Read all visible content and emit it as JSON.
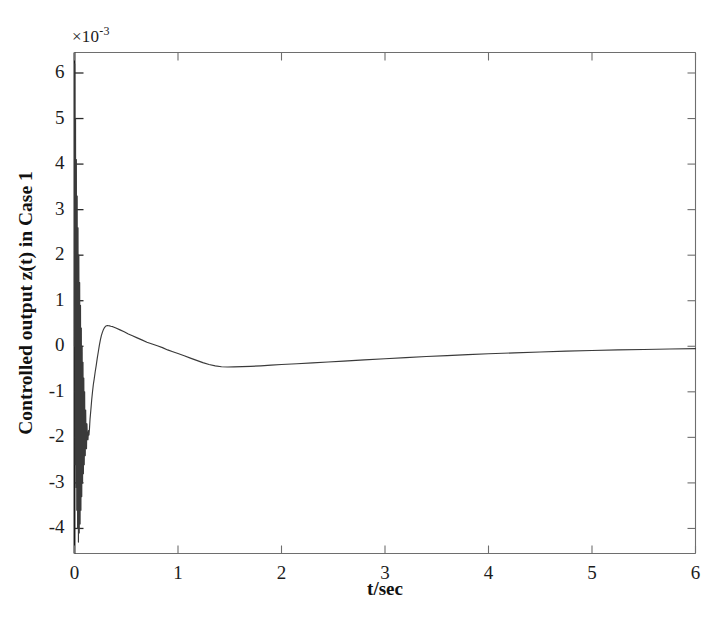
{
  "chart_data": {
    "type": "line",
    "title": "",
    "xlabel": "t/sec",
    "ylabel": "Controlled output z(t) in Case 1",
    "y_exponent_label": "×10",
    "y_exponent_value": "-3",
    "y_scale_factor": 0.001,
    "xlim": [
      0,
      6
    ],
    "ylim": [
      -4.55,
      6.45
    ],
    "xticks": [
      0,
      1,
      2,
      3,
      4,
      5,
      6
    ],
    "xtick_labels": [
      "0",
      "1",
      "2",
      "3",
      "4",
      "5",
      "6"
    ],
    "yticks": [
      6,
      5,
      4,
      3,
      2,
      1,
      0,
      -1,
      -2,
      -3,
      -4
    ],
    "ytick_labels": [
      "6",
      "5",
      "4",
      "3",
      "2",
      "1",
      "0",
      "-1",
      "-2",
      "-3",
      "-4"
    ],
    "grid": false,
    "legend": null,
    "line_color": "#3a3a3a",
    "background_color": "#ffffff",
    "axis_color": "#6e6e6e",
    "series": [
      {
        "name": "z(t) Case 1",
        "units": "x10^-3",
        "comment": "Values in units of 1e-3. Fast oscillatory transient near t=0 decaying within ~0.12 s, then smooth rise to a positive peak ~0.45 near t=0.30, decay through zero near t=0.85 to a trough ~-0.45 near t=1.45, then slow asymptotic approach toward ~-0.05 at t=6.",
        "points": [
          [
            0.0,
            0.0
          ],
          [
            0.002,
            6.2
          ],
          [
            0.004,
            2.1
          ],
          [
            0.006,
            -2.6
          ],
          [
            0.008,
            0.9
          ],
          [
            0.01,
            5.0
          ],
          [
            0.012,
            1.2
          ],
          [
            0.014,
            -3.1
          ],
          [
            0.016,
            -0.4
          ],
          [
            0.018,
            4.1
          ],
          [
            0.02,
            0.6
          ],
          [
            0.022,
            -3.6
          ],
          [
            0.024,
            -1.1
          ],
          [
            0.026,
            3.3
          ],
          [
            0.028,
            0.1
          ],
          [
            0.03,
            -4.0
          ],
          [
            0.032,
            -1.5
          ],
          [
            0.034,
            2.6
          ],
          [
            0.036,
            -0.3
          ],
          [
            0.038,
            -4.3
          ],
          [
            0.04,
            -1.8
          ],
          [
            0.042,
            2.0
          ],
          [
            0.044,
            -0.7
          ],
          [
            0.046,
            -4.1
          ],
          [
            0.048,
            -1.95
          ],
          [
            0.05,
            1.4
          ],
          [
            0.052,
            -1.0
          ],
          [
            0.054,
            -3.9
          ],
          [
            0.056,
            -2.05
          ],
          [
            0.058,
            0.9
          ],
          [
            0.06,
            -1.25
          ],
          [
            0.062,
            -3.6
          ],
          [
            0.064,
            -2.1
          ],
          [
            0.066,
            0.4
          ],
          [
            0.068,
            -1.45
          ],
          [
            0.07,
            -3.3
          ],
          [
            0.072,
            -2.12
          ],
          [
            0.074,
            0.0
          ],
          [
            0.076,
            -1.6
          ],
          [
            0.078,
            -3.0
          ],
          [
            0.08,
            -2.14
          ],
          [
            0.082,
            -0.35
          ],
          [
            0.084,
            -1.72
          ],
          [
            0.086,
            -2.8
          ],
          [
            0.088,
            -2.15
          ],
          [
            0.09,
            -0.7
          ],
          [
            0.092,
            -1.82
          ],
          [
            0.094,
            -2.6
          ],
          [
            0.096,
            -2.15
          ],
          [
            0.098,
            -1.0
          ],
          [
            0.1,
            -1.9
          ],
          [
            0.104,
            -2.4
          ],
          [
            0.108,
            -1.4
          ],
          [
            0.112,
            -2.1
          ],
          [
            0.116,
            -2.25
          ],
          [
            0.12,
            -1.7
          ],
          [
            0.125,
            -2.05
          ],
          [
            0.13,
            -2.05
          ],
          [
            0.135,
            -1.85
          ],
          [
            0.14,
            -1.95
          ],
          [
            0.145,
            -1.8
          ],
          [
            0.15,
            -1.6
          ],
          [
            0.158,
            -1.4
          ],
          [
            0.166,
            -1.18
          ],
          [
            0.174,
            -1.0
          ],
          [
            0.182,
            -0.84
          ],
          [
            0.19,
            -0.72
          ],
          [
            0.2,
            -0.56
          ],
          [
            0.21,
            -0.42
          ],
          [
            0.22,
            -0.26
          ],
          [
            0.23,
            -0.12
          ],
          [
            0.24,
            0.02
          ],
          [
            0.25,
            0.14
          ],
          [
            0.26,
            0.24
          ],
          [
            0.27,
            0.31
          ],
          [
            0.28,
            0.37
          ],
          [
            0.29,
            0.41
          ],
          [
            0.3,
            0.44
          ],
          [
            0.31,
            0.45
          ],
          [
            0.32,
            0.455
          ],
          [
            0.33,
            0.45
          ],
          [
            0.34,
            0.447
          ],
          [
            0.35,
            0.44
          ],
          [
            0.37,
            0.43
          ],
          [
            0.4,
            0.4
          ],
          [
            0.44,
            0.36
          ],
          [
            0.48,
            0.32
          ],
          [
            0.52,
            0.27
          ],
          [
            0.56,
            0.23
          ],
          [
            0.6,
            0.19
          ],
          [
            0.65,
            0.14
          ],
          [
            0.7,
            0.09
          ],
          [
            0.75,
            0.05
          ],
          [
            0.8,
            0.01
          ],
          [
            0.85,
            -0.03
          ],
          [
            0.9,
            -0.08
          ],
          [
            0.95,
            -0.12
          ],
          [
            1.0,
            -0.16
          ],
          [
            1.06,
            -0.21
          ],
          [
            1.12,
            -0.26
          ],
          [
            1.18,
            -0.31
          ],
          [
            1.24,
            -0.36
          ],
          [
            1.3,
            -0.4
          ],
          [
            1.36,
            -0.43
          ],
          [
            1.42,
            -0.45
          ],
          [
            1.48,
            -0.455
          ],
          [
            1.54,
            -0.452
          ],
          [
            1.62,
            -0.447
          ],
          [
            1.7,
            -0.44
          ],
          [
            1.8,
            -0.43
          ],
          [
            1.9,
            -0.415
          ],
          [
            2.0,
            -0.4
          ],
          [
            2.15,
            -0.385
          ],
          [
            2.3,
            -0.365
          ],
          [
            2.45,
            -0.345
          ],
          [
            2.6,
            -0.325
          ],
          [
            2.8,
            -0.3
          ],
          [
            3.0,
            -0.275
          ],
          [
            3.2,
            -0.25
          ],
          [
            3.4,
            -0.225
          ],
          [
            3.6,
            -0.205
          ],
          [
            3.8,
            -0.185
          ],
          [
            4.0,
            -0.165
          ],
          [
            4.25,
            -0.145
          ],
          [
            4.5,
            -0.125
          ],
          [
            4.75,
            -0.108
          ],
          [
            5.0,
            -0.092
          ],
          [
            5.25,
            -0.08
          ],
          [
            5.5,
            -0.07
          ],
          [
            5.75,
            -0.06
          ],
          [
            6.0,
            -0.052
          ]
        ]
      }
    ]
  },
  "axes": {
    "x_axis_label": "t/sec",
    "y_axis_label": "Controlled output z(t) in Case 1",
    "exponent_prefix": "×10",
    "exponent_superscript": "-3"
  }
}
